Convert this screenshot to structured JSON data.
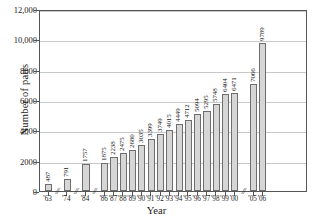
{
  "chart_data": {
    "type": "bar",
    "title": "",
    "xlabel": "Year",
    "ylabel": "Number of pairs",
    "ylim": [
      0,
      12000
    ],
    "grid": true,
    "legend": false,
    "yticks": [
      "0",
      "2000",
      "4000",
      "6000",
      "8000",
      "10,000",
      "12,000"
    ],
    "ytick_values": [
      0,
      2000,
      4000,
      6000,
      8000,
      10000,
      12000
    ],
    "categories": [
      "'63",
      "'74",
      "'84",
      "'86",
      "'87",
      "'88",
      "'89",
      "'90",
      "'91",
      "'92",
      "'93",
      "'94",
      "'95",
      "'96",
      "'97",
      "'98",
      "'99",
      "'00",
      "'05",
      "'06"
    ],
    "values": [
      487,
      791,
      1757,
      1875,
      2238,
      2475,
      2680,
      3035,
      3399,
      3749,
      4015,
      4449,
      4712,
      5094,
      5295,
      5748,
      6404,
      6471,
      7066,
      9789
    ],
    "value_labels": [
      "487",
      "791",
      "1757",
      "1875",
      "2238",
      "2475",
      "2680",
      "3035",
      "3399",
      "3749",
      "4015",
      "4449",
      "4712",
      "5094",
      "5295",
      "5748",
      "6404",
      "6471",
      "7066",
      "9789"
    ],
    "axis_breaks": [
      "//",
      "//",
      "//",
      "//"
    ],
    "bar_color": "#d6d6d6",
    "bar_edge_color": "#6e6e6e",
    "grid_color": "#c9c9c9",
    "axis_color": "#555555"
  }
}
